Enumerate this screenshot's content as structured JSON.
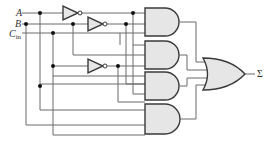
{
  "diagram": {
    "inputs": [
      {
        "name": "A",
        "label": "A",
        "sub": ""
      },
      {
        "name": "B",
        "label": "B",
        "sub": ""
      },
      {
        "name": "Cin",
        "label": "C",
        "sub": "in"
      }
    ],
    "output": {
      "name": "Sum",
      "label": "Σ"
    },
    "gates": {
      "not": [
        "NOT A",
        "NOT B",
        "NOT Cin"
      ],
      "and": [
        "AND 1",
        "AND 2",
        "AND 3",
        "AND 4"
      ],
      "or": [
        "OR"
      ]
    },
    "colors": {
      "gate_fill": "#e6e6e6",
      "gate_stroke": "#3a3a3a",
      "wire": "#6a6a6a",
      "junction": "#111111"
    }
  }
}
